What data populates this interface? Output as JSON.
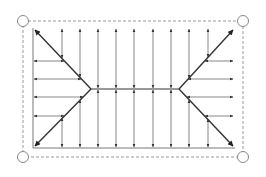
{
  "diagram": {
    "colors": {
      "line": "#333333",
      "thin": "#555555",
      "dashed": "#999999",
      "corner_circle": "#888888",
      "background": "#ffffff"
    },
    "outer_boundary": {
      "x1": 23,
      "y1": 21,
      "x2": 243,
      "y2": 157,
      "style": "dashed"
    },
    "corner_nodes": [
      {
        "id": "top-left",
        "cx": 23,
        "cy": 21
      },
      {
        "id": "top-right",
        "cx": 243,
        "cy": 21
      },
      {
        "id": "bottom-left",
        "cx": 23,
        "cy": 157
      },
      {
        "id": "bottom-right",
        "cx": 243,
        "cy": 157
      }
    ],
    "inner_area": {
      "x1": 33,
      "y1": 28,
      "x2": 235,
      "y2": 148
    },
    "ridge": {
      "x1": 91,
      "x2": 179,
      "y": 89
    },
    "hip_lines": [
      {
        "id": "hip-top-left",
        "from": [
          91,
          89
        ],
        "to": [
          35,
          30
        ]
      },
      {
        "id": "hip-bottom-left",
        "from": [
          91,
          89
        ],
        "to": [
          35,
          146
        ]
      },
      {
        "id": "hip-top-right",
        "from": [
          179,
          89
        ],
        "to": [
          233,
          30
        ]
      },
      {
        "id": "hip-bottom-right",
        "from": [
          179,
          89
        ],
        "to": [
          233,
          146
        ]
      }
    ],
    "vertical_arrows": [
      {
        "x": 62,
        "top_y1": 29,
        "top_y2": 58,
        "bot_y1": 118,
        "bot_y2": 147
      },
      {
        "x": 80,
        "top_y1": 29,
        "top_y2": 77,
        "bot_y1": 100,
        "bot_y2": 147
      },
      {
        "x": 98,
        "top_y1": 29,
        "top_y2": 88,
        "bot_y1": 90,
        "bot_y2": 147
      },
      {
        "x": 116,
        "top_y1": 29,
        "top_y2": 88,
        "bot_y1": 90,
        "bot_y2": 147
      },
      {
        "x": 134,
        "top_y1": 29,
        "top_y2": 88,
        "bot_y1": 90,
        "bot_y2": 147
      },
      {
        "x": 153,
        "top_y1": 29,
        "top_y2": 88,
        "bot_y1": 90,
        "bot_y2": 147
      },
      {
        "x": 171,
        "top_y1": 29,
        "top_y2": 88,
        "bot_y1": 90,
        "bot_y2": 147
      },
      {
        "x": 189,
        "top_y1": 29,
        "top_y2": 78,
        "bot_y1": 100,
        "bot_y2": 147
      },
      {
        "x": 208,
        "top_y1": 29,
        "top_y2": 57,
        "bot_y1": 119,
        "bot_y2": 147
      }
    ],
    "horizontal_arrows": [
      {
        "y": 61,
        "left_x1": 34,
        "left_x2": 64,
        "right_x1": 205,
        "right_x2": 233
      },
      {
        "y": 79,
        "left_x1": 34,
        "left_x2": 81,
        "right_x1": 188,
        "right_x2": 233
      },
      {
        "y": 97,
        "left_x1": 34,
        "left_x2": 83,
        "right_x1": 187,
        "right_x2": 233
      },
      {
        "y": 116,
        "left_x1": 34,
        "left_x2": 64,
        "right_x1": 205,
        "right_x2": 233
      }
    ],
    "bottom_edge": {
      "x1": 33,
      "x2": 235,
      "y": 148
    },
    "left_edge": {
      "x": 33,
      "y1": 28,
      "y2": 148
    }
  }
}
